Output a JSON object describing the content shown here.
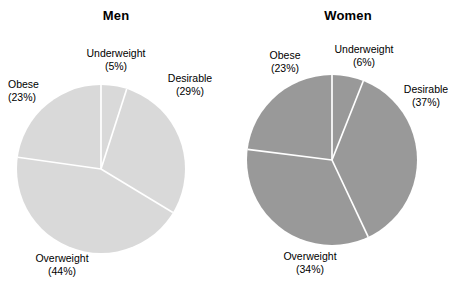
{
  "figure": {
    "background_color": "#ffffff",
    "divider_color": "#ffffff"
  },
  "panels": [
    {
      "id": "men",
      "title": "Men",
      "fill_color": "#d9d9d9",
      "stroke_color": "#ffffff",
      "center": {
        "x": 101,
        "y": 169
      },
      "radius": 84,
      "labels": {
        "underweight": {
          "name": "Underweight",
          "pct": "(5%)"
        },
        "desirable": {
          "name": "Desirable",
          "pct": "(29%)"
        },
        "obese": {
          "name": "Obese",
          "pct": "(23%)"
        },
        "overweight": {
          "name": "Overweight",
          "pct": "(44%)"
        }
      }
    },
    {
      "id": "women",
      "title": "Women",
      "fill_color": "#999999",
      "stroke_color": "#ffffff",
      "center": {
        "x": 100,
        "y": 160
      },
      "radius": 85,
      "labels": {
        "obese": {
          "name": "Obese",
          "pct": "(23%)"
        },
        "underweight": {
          "name": "Underweight",
          "pct": "(6%)"
        },
        "desirable": {
          "name": "Desirable",
          "pct": "(37%)"
        },
        "overweight": {
          "name": "Overweight",
          "pct": "(34%)"
        }
      }
    }
  ],
  "chart_data": [
    {
      "type": "pie",
      "title": "Men",
      "categories": [
        "Underweight",
        "Desirable",
        "Overweight",
        "Obese"
      ],
      "values": [
        5,
        29,
        44,
        23
      ],
      "value_labels": [
        "(5%)",
        "(29%)",
        "(44%)",
        "(23%)"
      ],
      "units": "percent",
      "start_angle_deg": 0,
      "direction": "clockwise",
      "slice_fill": "#d9d9d9",
      "slice_stroke": "#ffffff",
      "legend": "none",
      "labels_position": "outside",
      "grid": false
    },
    {
      "type": "pie",
      "title": "Women",
      "categories": [
        "Underweight",
        "Desirable",
        "Overweight",
        "Obese"
      ],
      "values": [
        6,
        37,
        34,
        23
      ],
      "value_labels": [
        "(6%)",
        "(37%)",
        "(34%)",
        "(23%)"
      ],
      "units": "percent",
      "start_angle_deg": 0,
      "direction": "clockwise",
      "slice_fill": "#999999",
      "slice_stroke": "#ffffff",
      "legend": "none",
      "labels_position": "outside",
      "grid": false
    }
  ]
}
